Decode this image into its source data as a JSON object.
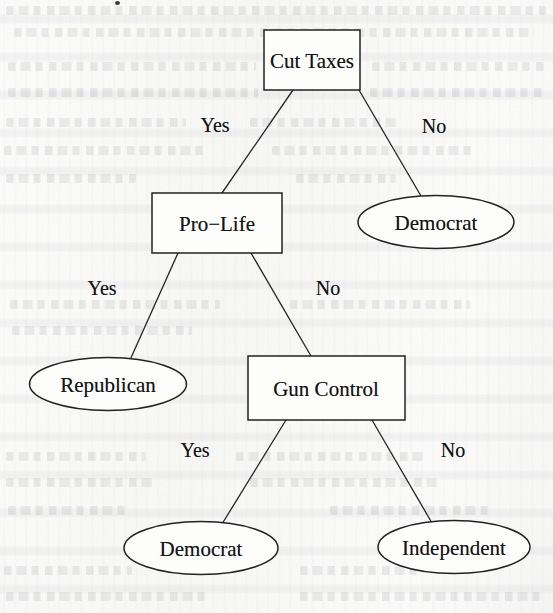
{
  "figure": {
    "type": "decision-tree",
    "canvas": {
      "width": 553,
      "height": 613
    }
  },
  "nodes": [
    {
      "id": "cut-taxes",
      "label": "Cut Taxes",
      "shape": "box",
      "role": "decision",
      "cx": 312,
      "cy": 60,
      "w": 96,
      "h": 60
    },
    {
      "id": "pro-life",
      "label": "Pro−Life",
      "shape": "box",
      "role": "decision",
      "cx": 217,
      "cy": 223,
      "w": 130,
      "h": 60
    },
    {
      "id": "democrat-1",
      "label": "Democrat",
      "shape": "ellipse",
      "role": "leaf",
      "cx": 436,
      "cy": 222,
      "w": 156,
      "h": 53
    },
    {
      "id": "republican",
      "label": "Republican",
      "shape": "ellipse",
      "role": "leaf",
      "cx": 108,
      "cy": 384,
      "w": 157,
      "h": 53
    },
    {
      "id": "gun-control",
      "label": "Gun Control",
      "shape": "box",
      "role": "decision",
      "cx": 326,
      "cy": 388,
      "w": 157,
      "h": 64
    },
    {
      "id": "democrat-2",
      "label": "Democrat",
      "shape": "ellipse",
      "role": "leaf",
      "cx": 201,
      "cy": 548,
      "w": 154,
      "h": 53
    },
    {
      "id": "independent",
      "label": "Independent",
      "shape": "ellipse",
      "role": "leaf",
      "cx": 454,
      "cy": 547,
      "w": 152,
      "h": 53
    }
  ],
  "edges": [
    {
      "id": "e1",
      "from": "cut-taxes",
      "to": "pro-life",
      "label": "Yes",
      "lx": 215,
      "ly": 125,
      "x1": 293,
      "y1": 90,
      "x2": 222,
      "y2": 193
    },
    {
      "id": "e2",
      "from": "cut-taxes",
      "to": "democrat-1",
      "label": "No",
      "lx": 434,
      "ly": 126,
      "x1": 359,
      "y1": 90,
      "x2": 421,
      "y2": 196
    },
    {
      "id": "e3",
      "from": "pro-life",
      "to": "republican",
      "label": "Yes",
      "lx": 102,
      "ly": 288,
      "x1": 178,
      "y1": 253,
      "x2": 130,
      "y2": 360
    },
    {
      "id": "e4",
      "from": "pro-life",
      "to": "gun-control",
      "label": "No",
      "lx": 328,
      "ly": 288,
      "x1": 251,
      "y1": 253,
      "x2": 311,
      "y2": 356
    },
    {
      "id": "e5",
      "from": "gun-control",
      "to": "democrat-2",
      "label": "Yes",
      "lx": 195,
      "ly": 450,
      "x1": 286,
      "y1": 420,
      "x2": 222,
      "y2": 524
    },
    {
      "id": "e6",
      "from": "gun-control",
      "to": "independent",
      "label": "No",
      "lx": 453,
      "ly": 450,
      "x1": 372,
      "y1": 420,
      "x2": 432,
      "y2": 523
    }
  ],
  "background": {
    "paper_color": "#fbfbfa",
    "ink_color": "#131315",
    "stroke_color": "#222224"
  }
}
